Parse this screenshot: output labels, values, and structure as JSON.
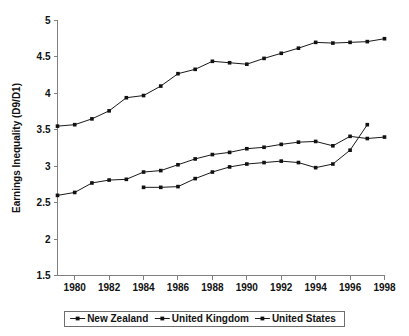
{
  "chart_data": {
    "type": "line",
    "title": "",
    "xlabel": "",
    "ylabel": "Earnings Inequality (D9/D1)",
    "xlim": [
      1979,
      1998
    ],
    "ylim": [
      1.5,
      5
    ],
    "ytick_labels": [
      "1.5",
      "2",
      "2.5",
      "3",
      "3.5",
      "4",
      "4.5",
      "5"
    ],
    "ytick_values": [
      1.5,
      2,
      2.5,
      3,
      3.5,
      4,
      4.5,
      5
    ],
    "xtick_labels": [
      "1980",
      "1982",
      "1984",
      "1986",
      "1988",
      "1990",
      "1992",
      "1994",
      "1996",
      "1998"
    ],
    "xtick_values": [
      1980,
      1982,
      1984,
      1986,
      1988,
      1990,
      1992,
      1994,
      1996,
      1998
    ],
    "grid": false,
    "legend_position": "bottom",
    "marker": "square",
    "line_color": "#1a1a1a",
    "series": [
      {
        "name": "New Zealand",
        "x": [
          1984,
          1985,
          1986,
          1987,
          1988,
          1989,
          1990,
          1991,
          1992,
          1993,
          1994,
          1995,
          1996,
          1997
        ],
        "values": [
          2.71,
          2.71,
          2.72,
          2.83,
          2.92,
          2.99,
          3.03,
          3.05,
          3.07,
          3.05,
          2.98,
          3.03,
          3.22,
          3.57
        ]
      },
      {
        "name": "United Kingdom",
        "x": [
          1979,
          1980,
          1981,
          1982,
          1983,
          1984,
          1985,
          1986,
          1987,
          1988,
          1989,
          1990,
          1991,
          1992,
          1993,
          1994,
          1995,
          1996,
          1997,
          1998
        ],
        "values": [
          2.6,
          2.64,
          2.77,
          2.81,
          2.82,
          2.92,
          2.94,
          3.02,
          3.1,
          3.16,
          3.19,
          3.24,
          3.26,
          3.3,
          3.33,
          3.34,
          3.28,
          3.41,
          3.38,
          3.4
        ]
      },
      {
        "name": "United States",
        "x": [
          1979,
          1980,
          1981,
          1982,
          1983,
          1984,
          1985,
          1986,
          1987,
          1988,
          1989,
          1990,
          1991,
          1992,
          1993,
          1994,
          1995,
          1996,
          1997,
          1998
        ],
        "values": [
          3.55,
          3.57,
          3.65,
          3.76,
          3.94,
          3.97,
          4.1,
          4.27,
          4.33,
          4.44,
          4.42,
          4.4,
          4.48,
          4.55,
          4.62,
          4.7,
          4.69,
          4.7,
          4.71,
          4.75
        ]
      }
    ],
    "legend_entries": [
      "New Zealand",
      "United Kingdom",
      "United States"
    ]
  }
}
